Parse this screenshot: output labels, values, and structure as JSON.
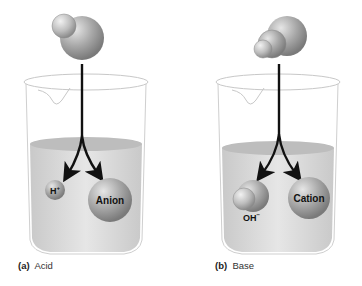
{
  "panels": [
    {
      "id": "a",
      "letter": "(a)",
      "caption": "Acid",
      "molecule": "acid-molecule",
      "ions": [
        {
          "label": "H",
          "superscript": "+",
          "name": "hydrogen-ion"
        },
        {
          "label": "Anion",
          "name": "anion"
        }
      ]
    },
    {
      "id": "b",
      "letter": "(b)",
      "caption": "Base",
      "molecule": "base-molecule",
      "ions": [
        {
          "label": "OH",
          "superscript": "−",
          "name": "hydroxide-ion"
        },
        {
          "label": "Cation",
          "name": "cation"
        }
      ]
    }
  ],
  "colors": {
    "sphere": "#9a9a9a",
    "sphere_highlight": "#d8d8d8",
    "liquid": "#d4d4d4",
    "arrow": "#111111",
    "glass": "#c8c8c8"
  }
}
